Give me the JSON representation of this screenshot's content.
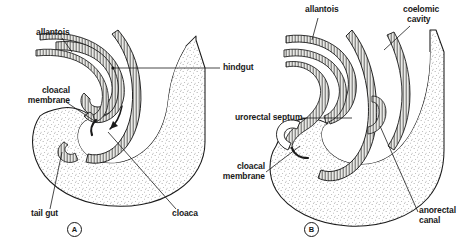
{
  "figure": {
    "background_color": "#ffffff",
    "ink_color": "#1a1a1a",
    "mesenchyme_fill": "#f4f4f2",
    "stipple_color": "#555555"
  },
  "panels": [
    {
      "id": "A",
      "marker": "A",
      "labels": [
        {
          "key": "allantois",
          "text": "allantois",
          "lines": [
            "allantois"
          ]
        },
        {
          "key": "cloacal_membrane",
          "text": "cloacal membrane",
          "lines": [
            "cloacal",
            "membrane"
          ]
        },
        {
          "key": "hindgut",
          "text": "hindgut",
          "lines": [
            "hindgut"
          ]
        },
        {
          "key": "tail_gut",
          "text": "tail gut",
          "lines": [
            "tail gut"
          ]
        },
        {
          "key": "cloaca",
          "text": "cloaca",
          "lines": [
            "cloaca"
          ]
        }
      ]
    },
    {
      "id": "B",
      "marker": "B",
      "labels": [
        {
          "key": "allantois",
          "text": "allantois",
          "lines": [
            "allantois"
          ]
        },
        {
          "key": "coelomic_cavity",
          "text": "coelomic cavity",
          "lines": [
            "coelomic",
            "cavity"
          ]
        },
        {
          "key": "urorectal_septum",
          "text": "urorectal septum",
          "lines": [
            "urorectal septum"
          ]
        },
        {
          "key": "cloacal_membrane",
          "text": "cloacal membrane",
          "lines": [
            "cloacal",
            "membrane"
          ]
        },
        {
          "key": "anorectal_canal",
          "text": "anorectal canal",
          "lines": [
            "anorectal",
            "canal"
          ]
        }
      ]
    }
  ],
  "text": {
    "a_allantois": "allantois",
    "a_cloacal_1": "cloacal",
    "a_cloacal_2": "membrane",
    "a_hindgut": "hindgut",
    "a_tailgut": "tail gut",
    "a_cloaca": "cloaca",
    "a_marker": "A",
    "b_allantois": "allantois",
    "b_coelomic_1": "coelomic",
    "b_coelomic_2": "cavity",
    "b_urorectal": "urorectal septum",
    "b_cloacal_1": "cloacal",
    "b_cloacal_2": "membrane",
    "b_anorectal_1": "anorectal",
    "b_anorectal_2": "canal",
    "b_marker": "B"
  }
}
